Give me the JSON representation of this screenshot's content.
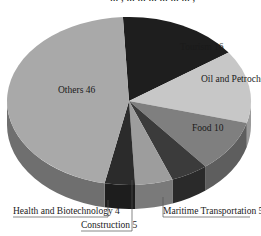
{
  "cut_off_title": "... , ... ... ... ... ... ... ,",
  "chart_data": {
    "type": "pie",
    "style": "3d",
    "title": "",
    "slices": [
      {
        "label": "Tourism",
        "value": 16,
        "color": "#1e1e1e",
        "side": "#141414"
      },
      {
        "label": "Oil and Petrochemicals",
        "value": 14,
        "color": "#c7c7c7",
        "side": "#9a9a9a"
      },
      {
        "label": "Food",
        "value": 10,
        "color": "#7f7f7f",
        "side": "#5e5e5e"
      },
      {
        "label": "Maritime Transportation",
        "value": 5,
        "color": "#3b3b3b",
        "side": "#2a2a2a"
      },
      {
        "label": "Construction",
        "value": 5,
        "color": "#9d9d9d",
        "side": "#7a7a7a"
      },
      {
        "label": "Health and Biotechnology",
        "value": 4,
        "color": "#2b2b2b",
        "side": "#1d1d1d"
      },
      {
        "label": "Others",
        "value": 46,
        "color": "#a9a9a9",
        "side": "#6f6f6f"
      }
    ],
    "labels": [
      {
        "text": "Tourism 16",
        "x": 180,
        "y": 50,
        "leader": false
      },
      {
        "text": "Oil and Petrochemicals 14",
        "x": 201,
        "y": 82,
        "leader": false
      },
      {
        "text": "Food 10",
        "x": 192,
        "y": 131,
        "leader": false
      },
      {
        "text": "Others 46",
        "x": 58,
        "y": 93,
        "leader": false
      },
      {
        "text": "Health and Biotechnology 4",
        "x": 13,
        "y": 214,
        "leader": true
      },
      {
        "text": "Construction 5",
        "x": 81,
        "y": 228,
        "leader": true
      },
      {
        "text": "Maritime Transportation 5",
        "x": 163,
        "y": 214,
        "leader": true
      }
    ],
    "legend": "none"
  }
}
